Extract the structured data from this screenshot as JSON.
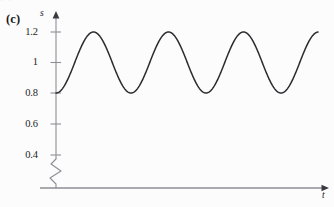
{
  "figure": {
    "panel_label": "(c)",
    "top_cut_text": "(b)",
    "background_color": "#fcfcfc",
    "curve_color": "#2b2b30",
    "axis_color": "#8e8e95",
    "text_color": "#1d1d23"
  },
  "axes": {
    "y_axis_label": "s",
    "x_axis_label": "t",
    "y_tick_labels": [
      "1.2",
      "1",
      "0.8",
      "0.6",
      "0.4"
    ],
    "y_tick_values": [
      1.2,
      1.0,
      0.8,
      0.6,
      0.4
    ],
    "axis_break": "zigzag",
    "x_ticks_shown": "none",
    "grid": "off"
  },
  "chart_data": {
    "type": "line",
    "title": "(c)",
    "xlabel": "t",
    "ylabel": "s",
    "grid": false,
    "legend": "none",
    "ylim": [
      0.3,
      1.28
    ],
    "xlim": [
      0,
      1
    ],
    "y_ticks": [
      0.4,
      0.6,
      0.8,
      1.0,
      1.2
    ],
    "y_tick_labels": [
      "0.4",
      "0.6",
      "0.8",
      "1",
      "1.2"
    ],
    "x_ticks": [],
    "axis_break_below": 0.4,
    "series": [
      {
        "name": "s(t)",
        "description": "undamped sinusoidal oscillation, constant amplitude",
        "form": "s(t) = 1.0 - 0.2*cos(2*pi*t/T)",
        "mean": 1.0,
        "amplitude": 0.2,
        "min": 0.8,
        "max": 1.2,
        "period_px": 75,
        "start_value": 0.8,
        "end_value": 1.2,
        "peaks_x_px": [
          94,
          169,
          244,
          318
        ],
        "troughs_x_px": [
          56,
          131,
          206,
          281
        ],
        "peak_value": 1.2,
        "trough_value": 0.8,
        "cycles_shown": 3.5
      }
    ]
  },
  "geometry": {
    "y_axis_x_px": 56,
    "x_axis_y_px": 188,
    "y_top_px": 14,
    "x_right_px": 327,
    "tick_y_px": [
      32,
      62.5,
      93,
      124,
      155
    ],
    "break_top_px": 159,
    "break_bottom_px": 184
  }
}
